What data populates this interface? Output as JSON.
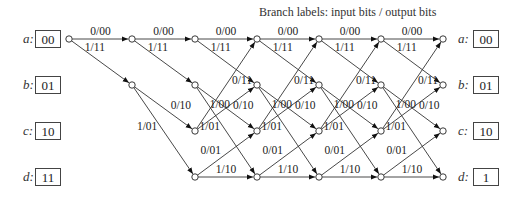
{
  "title": "Branch labels:  input bits / output bits",
  "states_left": [
    {
      "letter": "a:",
      "bits": "00"
    },
    {
      "letter": "b:",
      "bits": "01"
    },
    {
      "letter": "c:",
      "bits": "10"
    },
    {
      "letter": "d:",
      "bits": "11"
    }
  ],
  "states_right": [
    {
      "letter": "a:",
      "bits": "00"
    },
    {
      "letter": "b:",
      "bits": "01"
    },
    {
      "letter": "c:",
      "bits": "10"
    },
    {
      "letter": "d:",
      "bits": "1"
    }
  ],
  "trellis": {
    "columns_x": [
      69,
      132,
      195,
      257,
      319,
      381,
      443
    ],
    "rows_y": {
      "a": 39,
      "b": 85,
      "c": 131,
      "d": 177
    },
    "transitions": [
      {
        "from": "a",
        "to": "a",
        "label": "0/00"
      },
      {
        "from": "a",
        "to": "b",
        "label": "1/11"
      },
      {
        "from": "b",
        "to": "c",
        "label": "0/10"
      },
      {
        "from": "b",
        "to": "d",
        "label": "1/01"
      },
      {
        "from": "c",
        "to": "a",
        "label": "0/11"
      },
      {
        "from": "c",
        "to": "b",
        "label": "1/00"
      },
      {
        "from": "d",
        "to": "c",
        "label": "0/01"
      },
      {
        "from": "d",
        "to": "d",
        "label": "1/10"
      }
    ],
    "start_state": "a"
  }
}
